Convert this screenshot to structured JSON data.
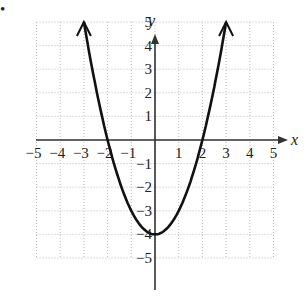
{
  "chart_data": {
    "type": "line",
    "title": "",
    "xlabel": "x",
    "ylabel": "y",
    "xlim": [
      -5,
      5
    ],
    "ylim": [
      -5,
      5
    ],
    "grid": true,
    "x_ticks": [
      "−5",
      "−4",
      "−3",
      "−2",
      "−1",
      "1",
      "2",
      "3",
      "4",
      "5"
    ],
    "y_ticks": [
      "5",
      "4",
      "3",
      "2",
      "1",
      "−1",
      "−2",
      "−3",
      "−4",
      "−5"
    ],
    "series": [
      {
        "name": "y = x² − 4",
        "x": [
          -3,
          -2,
          -1,
          0,
          1,
          2,
          3
        ],
        "y": [
          5,
          0,
          -3,
          -4,
          -3,
          0,
          5
        ],
        "arrows_at_ends": true
      }
    ]
  },
  "labels": {
    "x_axis": "x",
    "y_axis": "y",
    "bullet": "•"
  }
}
